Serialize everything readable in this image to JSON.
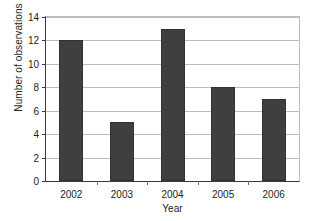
{
  "chart_data": {
    "type": "bar",
    "title": "",
    "subtitle": "",
    "xlabel": "Year",
    "ylabel": "Number of observations",
    "categories": [
      "2002",
      "2003",
      "2004",
      "2005",
      "2006"
    ],
    "values": [
      12,
      5,
      13,
      8,
      7
    ],
    "series": [
      {
        "name": "Number of observations",
        "values": [
          12,
          5,
          13,
          8,
          7
        ]
      }
    ],
    "ylim": [
      0,
      14
    ],
    "ytick_values": [
      0,
      2,
      4,
      6,
      8,
      10,
      12,
      14
    ],
    "ytick_labels": [
      "0",
      "2",
      "4",
      "6",
      "8",
      "10",
      "12",
      "14"
    ],
    "xtick_labels": [
      "2002",
      "2003",
      "2004",
      "2005",
      "2006"
    ],
    "grid": {
      "horizontal": true,
      "vertical": false
    },
    "legend": {
      "visible": false,
      "position": "none",
      "entries": []
    },
    "annotations": [],
    "colors": {
      "bar_fill": "#403f3f",
      "bar_edge": "#333232",
      "gridline": "#bcbcbc",
      "axis_line": "#3b3b3b",
      "plot_background": "#ffffff",
      "figure_background": "#ffffff",
      "text": "#231f20"
    }
  }
}
